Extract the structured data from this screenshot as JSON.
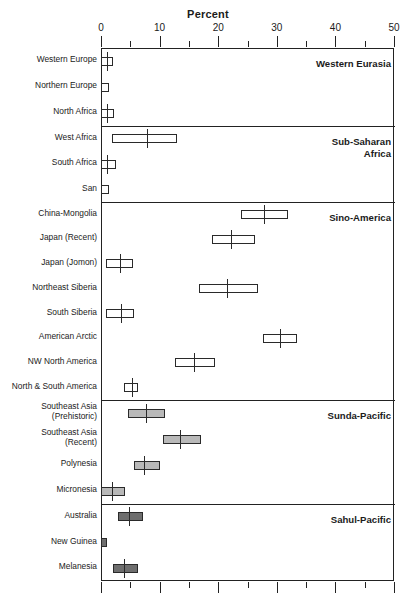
{
  "chart_data": {
    "type": "bar",
    "title": "Percent",
    "xlabel": "Percent",
    "ylabel": "",
    "xlim": [
      0,
      50
    ],
    "xticks": [
      0,
      10,
      20,
      30,
      40,
      50
    ],
    "xtick_labels": [
      "0",
      "10",
      "20",
      "30",
      "40",
      "50"
    ],
    "minor_tick_step": 5,
    "grid": false,
    "legend": "none",
    "panels": [
      {
        "name": "Western Eurasia",
        "fill": "plain",
        "rows": [
          {
            "label": "Western Europe",
            "box_start": 0.0,
            "box_end": 2.1,
            "center": 1.0
          },
          {
            "label": "Northern Europe",
            "box_start": 0.0,
            "box_end": 1.4,
            "center": null
          },
          {
            "label": "North Africa",
            "box_start": 0.0,
            "box_end": 2.3,
            "center": 1.1
          }
        ]
      },
      {
        "name": "Sub-Saharan\nAfrica",
        "fill": "plain",
        "rows": [
          {
            "label": "West Africa",
            "box_start": 1.9,
            "box_end": 13.0,
            "center": 7.9
          },
          {
            "label": "South Africa",
            "box_start": 0.0,
            "box_end": 2.6,
            "center": 1.0
          },
          {
            "label": "San",
            "box_start": 0.0,
            "box_end": 1.3,
            "center": null
          }
        ]
      },
      {
        "name": "Sino-America",
        "fill": "plain",
        "rows": [
          {
            "label": "China-Mongolia",
            "box_start": 23.9,
            "box_end": 31.9,
            "center": 27.8
          },
          {
            "label": "Japan (Recent)",
            "box_start": 19.0,
            "box_end": 26.3,
            "center": 22.2
          },
          {
            "label": "Japan (Jomon)",
            "box_start": 0.9,
            "box_end": 5.5,
            "center": 3.2
          },
          {
            "label": "Northeast Siberia",
            "box_start": 16.7,
            "box_end": 26.8,
            "center": 21.5
          },
          {
            "label": "South Siberia",
            "box_start": 0.9,
            "box_end": 5.6,
            "center": 3.4
          },
          {
            "label": "American Arctic",
            "box_start": 27.6,
            "box_end": 33.4,
            "center": 30.5
          },
          {
            "label": "NW North America",
            "box_start": 12.7,
            "box_end": 19.4,
            "center": 15.9
          },
          {
            "label": "North & South America",
            "box_start": 3.9,
            "box_end": 6.4,
            "center": 5.3
          }
        ]
      },
      {
        "name": "Sunda-Pacific",
        "fill": "lightgray",
        "rows": [
          {
            "label": "Southeast Asia\n(Prehistoric)",
            "box_start": 4.6,
            "box_end": 11.0,
            "center": 7.7
          },
          {
            "label": "Southeast Asia\n(Recent)",
            "box_start": 10.6,
            "box_end": 17.0,
            "center": 13.5
          },
          {
            "label": "Polynesia",
            "box_start": 5.6,
            "box_end": 10.1,
            "center": 7.4
          },
          {
            "label": "Micronesia",
            "box_start": 0.0,
            "box_end": 4.1,
            "center": 1.9
          }
        ]
      },
      {
        "name": "Sahul-Pacific",
        "fill": "darkgray",
        "rows": [
          {
            "label": "Australia",
            "box_start": 2.9,
            "box_end": 7.2,
            "center": 4.7
          },
          {
            "label": "New Guinea",
            "box_start": 0.0,
            "box_end": 1.0,
            "center": null
          },
          {
            "label": "Melanesia",
            "box_start": 2.1,
            "box_end": 6.3,
            "center": 4.0
          }
        ]
      }
    ]
  }
}
